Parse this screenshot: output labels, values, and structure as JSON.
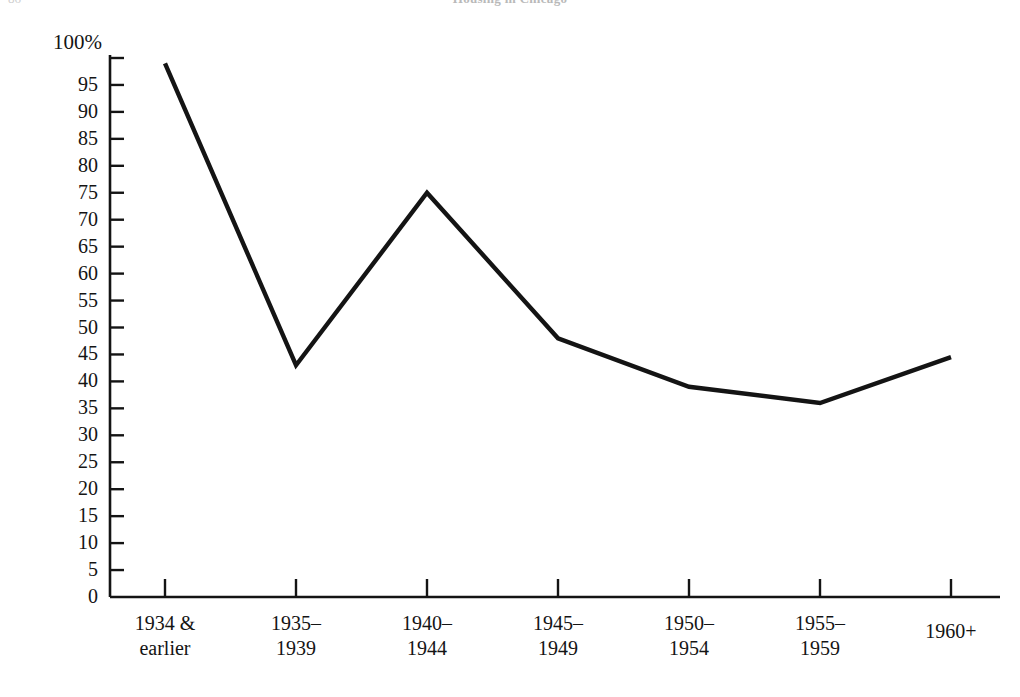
{
  "page": {
    "folio": "86",
    "running_head": "Housing in Chicago"
  },
  "chart_data": {
    "type": "line",
    "title": "",
    "subtitle": "",
    "xlabel": "",
    "ylabel": "",
    "categories": [
      "1934 & earlier",
      "1935–1939",
      "1940–1944",
      "1945–1949",
      "1950–1954",
      "1955–1959",
      "1960+"
    ],
    "category_lines": [
      [
        "1934 &",
        "earlier"
      ],
      [
        "1935–",
        "1939"
      ],
      [
        "1940–",
        "1944"
      ],
      [
        "1945–",
        "1949"
      ],
      [
        "1950–",
        "1954"
      ],
      [
        "1955–",
        "1959"
      ],
      [
        "1960+",
        ""
      ]
    ],
    "values": [
      99,
      43,
      75,
      48,
      39,
      36,
      44.5
    ],
    "series": [
      {
        "name": "Percent",
        "values": [
          99,
          43,
          75,
          48,
          39,
          36,
          44.5
        ]
      }
    ],
    "ylim": [
      0,
      100
    ],
    "ytick_step": 5,
    "yticks": [
      0,
      5,
      10,
      15,
      20,
      25,
      30,
      35,
      40,
      45,
      50,
      55,
      60,
      65,
      70,
      75,
      80,
      85,
      90,
      95,
      100
    ],
    "ytick_labels": [
      "0",
      "5",
      "10",
      "15",
      "20",
      "25",
      "30",
      "35",
      "40",
      "45",
      "50",
      "55",
      "60",
      "65",
      "70",
      "75",
      "80",
      "85",
      "90",
      "95",
      "100%"
    ],
    "grid": false,
    "legend": "none",
    "line_color": "#141414",
    "axis_color": "#141414",
    "background_color": "#ffffff"
  }
}
